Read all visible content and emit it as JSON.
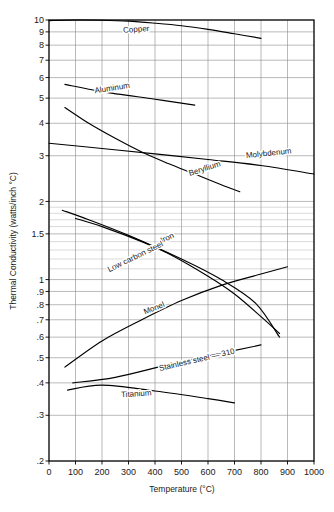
{
  "chart_data": {
    "type": "line",
    "title": "",
    "xlabel": "Temperature (°C)",
    "ylabel": "Thermal Conductivity (watts/inch °C)",
    "xlim": [
      0,
      1000
    ],
    "ylim": [
      0.2,
      10
    ],
    "yscale": "log",
    "xscale": "linear",
    "grid": true,
    "legend_position": "inline-labels",
    "xticks": [
      "0",
      "100",
      "200",
      "300",
      "400",
      "500",
      "600",
      "700",
      "800",
      "900",
      "1000"
    ],
    "xtick_values": [
      0,
      100,
      200,
      300,
      400,
      500,
      600,
      700,
      800,
      900,
      1000
    ],
    "yticks": [
      "10",
      "9",
      "8",
      "7",
      "6",
      "5",
      "4",
      "3",
      "2",
      "1.5",
      "1",
      ".9",
      ".8",
      ".7",
      ".6",
      ".5",
      ".4",
      ".3",
      ".2"
    ],
    "ytick_values": [
      10,
      9,
      8,
      7,
      6,
      5,
      4,
      3,
      2,
      1.5,
      1,
      0.9,
      0.8,
      0.7,
      0.6,
      0.5,
      0.4,
      0.3,
      0.2
    ],
    "series": [
      {
        "name": "Copper",
        "label": "Copper",
        "label_x": 330,
        "label_y": 9.0,
        "label_rotation": -4,
        "x": [
          0,
          100,
          200,
          300,
          400,
          500,
          600,
          700,
          800
        ],
        "y": [
          9.95,
          10.0,
          9.98,
          9.9,
          9.72,
          9.5,
          9.2,
          8.85,
          8.5
        ]
      },
      {
        "name": "Aluminum",
        "label": "Aluminum",
        "label_x": 240,
        "label_y": 5.35,
        "label_rotation": -9,
        "x": [
          60,
          200,
          400,
          550
        ],
        "y": [
          5.65,
          5.3,
          4.95,
          4.7
        ]
      },
      {
        "name": "Beryllium",
        "label": "Beryllium",
        "label_x": 590,
        "label_y": 2.62,
        "label_rotation": -18,
        "x": [
          60,
          150,
          250,
          350,
          450,
          550,
          650,
          720
        ],
        "y": [
          4.6,
          4.0,
          3.5,
          3.1,
          2.8,
          2.55,
          2.32,
          2.18
        ]
      },
      {
        "name": "Molybdenum",
        "label": "Molybdenum",
        "label_x": 830,
        "label_y": 3.0,
        "label_rotation": -6,
        "x": [
          0,
          200,
          400,
          600,
          800,
          1000
        ],
        "y": [
          3.35,
          3.2,
          3.05,
          2.9,
          2.75,
          2.55
        ]
      },
      {
        "name": "Iron",
        "label": "Iron",
        "label_x": 450,
        "label_y": 1.42,
        "label_rotation": -25,
        "x": [
          50,
          150,
          300,
          450,
          600,
          700,
          800,
          870
        ],
        "y": [
          1.85,
          1.7,
          1.48,
          1.26,
          1.03,
          0.88,
          0.72,
          0.62
        ]
      },
      {
        "name": "Low carbon steel",
        "label": "Low carbon steel",
        "label_x": 330,
        "label_y": 1.2,
        "label_rotation": -26,
        "x": [
          100,
          200,
          350,
          500,
          650,
          780,
          870
        ],
        "y": [
          1.72,
          1.6,
          1.4,
          1.2,
          1.0,
          0.81,
          0.6
        ]
      },
      {
        "name": "Monel",
        "label": "Monel",
        "label_x": 400,
        "label_y": 0.76,
        "label_rotation": -22,
        "x": [
          60,
          200,
          350,
          500,
          650,
          800,
          900
        ],
        "y": [
          0.46,
          0.58,
          0.7,
          0.83,
          0.95,
          1.05,
          1.12
        ]
      },
      {
        "name": "Stainless steel — 310",
        "label": "Stainless steel — 310",
        "label_x": 560,
        "label_y": 0.48,
        "label_rotation": -13,
        "x": [
          90,
          250,
          450,
          650,
          800
        ],
        "y": [
          0.4,
          0.42,
          0.47,
          0.52,
          0.56
        ]
      },
      {
        "name": "Titanium",
        "label": "Titanium",
        "label_x": 330,
        "label_y": 0.355,
        "label_rotation": -4,
        "x": [
          70,
          200,
          400,
          600,
          700
        ],
        "y": [
          0.375,
          0.392,
          0.372,
          0.348,
          0.335
        ]
      }
    ]
  }
}
